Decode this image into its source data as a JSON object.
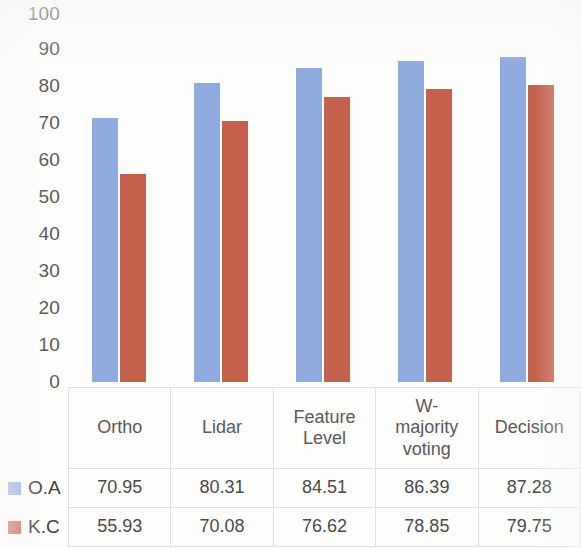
{
  "chart_data": {
    "type": "bar",
    "title": "",
    "xlabel": "",
    "ylabel": "",
    "ylim": [
      0,
      100
    ],
    "ytick_step": 10,
    "yticks": [
      "100",
      "90",
      "80",
      "70",
      "60",
      "50",
      "40",
      "30",
      "20",
      "10",
      "0"
    ],
    "grid": false,
    "legend_position": "bottom-left-table",
    "categories": [
      "Ortho",
      "Lidar",
      "Feature Level",
      "W-majority voting",
      "Decision"
    ],
    "series": [
      {
        "name": "O.A",
        "color": "#8FAADC",
        "values": [
          70.95,
          80.31,
          84.51,
          86.39,
          87.28
        ],
        "labels": [
          "70.95",
          "80.31",
          "84.51",
          "86.39",
          "87.28"
        ]
      },
      {
        "name": "K.C",
        "color": "#C3614E",
        "values": [
          55.93,
          70.08,
          76.62,
          78.85,
          79.75
        ],
        "labels": [
          "55.93",
          "70.08",
          "76.62",
          "78.85",
          "79.75"
        ]
      }
    ]
  },
  "axis": {
    "yticks": [
      "100",
      "90",
      "80",
      "70",
      "60",
      "50",
      "40",
      "30",
      "20",
      "10",
      "0"
    ]
  },
  "table": {
    "headers": [
      "Ortho",
      "Lidar",
      "Feature Level",
      "W-majority voting",
      "Decision"
    ],
    "header_lines": [
      [
        "Ortho"
      ],
      [
        "Lidar"
      ],
      [
        "Feature",
        "Level"
      ],
      [
        "W-",
        "majority",
        "voting"
      ],
      [
        "Decision"
      ]
    ],
    "rows": [
      {
        "name": "O.A",
        "color": "#8FAADC",
        "cells": [
          "70.95",
          "80.31",
          "84.51",
          "86.39",
          "87.28"
        ]
      },
      {
        "name": "K.C",
        "color": "#C3614E",
        "cells": [
          "55.93",
          "70.08",
          "76.62",
          "78.85",
          "79.75"
        ]
      }
    ]
  }
}
